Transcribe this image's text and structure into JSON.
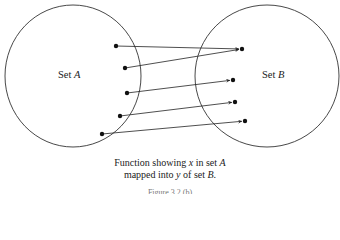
{
  "diagram": {
    "set_a": {
      "label_prefix": "Set ",
      "label_var": "A"
    },
    "set_b": {
      "label_prefix": "Set ",
      "label_var": "B"
    },
    "mappings": [
      {
        "from": [
          116,
          46
        ],
        "to": [
          242,
          49
        ]
      },
      {
        "from": [
          125,
          68
        ],
        "to": [
          242,
          49
        ]
      },
      {
        "from": [
          127,
          93
        ],
        "to": [
          233,
          80
        ]
      },
      {
        "from": [
          120,
          116
        ],
        "to": [
          235,
          102
        ]
      },
      {
        "from": [
          102,
          134
        ],
        "to": [
          245,
          121
        ]
      }
    ],
    "codomain_points": [
      [
        242,
        49
      ],
      [
        233,
        80
      ],
      [
        235,
        102
      ],
      [
        245,
        121
      ]
    ]
  },
  "caption": {
    "line1_a": "Function showing ",
    "line1_x": "x",
    "line1_b": " in set ",
    "line1_A": "A",
    "line2_a": "mapped into ",
    "line2_y": "y",
    "line2_b": " of set ",
    "line2_B": "B",
    "line2_end": ".",
    "figure_label": "Figure 3.2.(b)"
  }
}
